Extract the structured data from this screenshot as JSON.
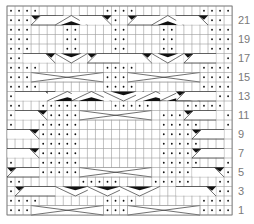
{
  "chart": {
    "columns": 28,
    "rows_count": 22,
    "grid": {
      "left": 7,
      "top": 6,
      "cell_w": 8.04,
      "cell_h": 9.5
    },
    "colors": {
      "grid": "#9a9a9a",
      "border": "#7a7a7a",
      "dot": "#111111",
      "fill": "#111111",
      "label": "#7a7a7a"
    },
    "legend_symbols": {
      ".": "purl",
      "-": "knit (blank)"
    },
    "rows_top_to_bottom": [
      "....--------....--------....",
      "...---------..----------...",
      "...----..----..----..----...",
      "...----..----..----..----...",
      "...----..----..----..----...",
      "...------------------------...",
      "....--------....--------....",
      "....--------....--------....",
      "....--------....--------....",
      "..------------------------..",
      "..--.....----.....----.....--..",
      ".---.....----------.....---.",
      ".---.....----------.....---.",
      "----.....----------.....----",
      "----.....----------.....----",
      "----.....----------.....----",
      ".---.....----------.....---.",
      ".---.....----------.....---.",
      "..-------.....----.....---..",
      "..------------------------..",
      "....--------....--------....",
      "....--------....--------...."
    ],
    "row_labels": [
      {
        "row": 21,
        "text": "21"
      },
      {
        "row": 19,
        "text": "19"
      },
      {
        "row": 17,
        "text": "17"
      },
      {
        "row": 15,
        "text": "15"
      },
      {
        "row": 13,
        "text": "13"
      },
      {
        "row": 11,
        "text": "11"
      },
      {
        "row": 9,
        "text": "9"
      },
      {
        "row": 7,
        "text": "7"
      },
      {
        "row": 5,
        "text": "5"
      },
      {
        "row": 3,
        "text": "3"
      },
      {
        "row": 1,
        "text": "1"
      }
    ],
    "cables": [
      {
        "row": 21,
        "type": "right",
        "from": 4,
        "to": 7
      },
      {
        "row": 21,
        "type": "peak",
        "from": 7,
        "to": 10
      },
      {
        "row": 21,
        "type": "left",
        "from": 10,
        "to": 13
      },
      {
        "row": 21,
        "type": "right",
        "from": 16,
        "to": 19
      },
      {
        "row": 21,
        "type": "peak",
        "from": 19,
        "to": 22
      },
      {
        "row": 21,
        "type": "left",
        "from": 22,
        "to": 25
      },
      {
        "row": 17,
        "type": "left",
        "from": 3,
        "to": 6
      },
      {
        "row": 17,
        "type": "valley",
        "from": 7,
        "to": 10
      },
      {
        "row": 17,
        "type": "right",
        "from": 11,
        "to": 14
      },
      {
        "row": 17,
        "type": "left",
        "from": 15,
        "to": 18
      },
      {
        "row": 17,
        "type": "valley",
        "from": 19,
        "to": 22
      },
      {
        "row": 17,
        "type": "right",
        "from": 23,
        "to": 26
      },
      {
        "row": 15,
        "type": "cross",
        "from": 4,
        "to": 12
      },
      {
        "row": 15,
        "type": "cross",
        "from": 16,
        "to": 24
      },
      {
        "row": 13,
        "type": "left",
        "from": 2,
        "to": 6
      },
      {
        "row": 13,
        "type": "peakfill",
        "from": 6,
        "to": 10
      },
      {
        "row": 13,
        "type": "peakfill",
        "from": 9,
        "to": 13
      },
      {
        "row": 13,
        "type": "valleyfill",
        "from": 13,
        "to": 17
      },
      {
        "row": 13,
        "type": "peakfill",
        "from": 17,
        "to": 21
      },
      {
        "row": 13,
        "type": "peakfill",
        "from": 20,
        "to": 24
      },
      {
        "row": 13,
        "type": "right",
        "from": 22,
        "to": 26
      },
      {
        "row": 11,
        "type": "left",
        "from": 2,
        "to": 5
      },
      {
        "row": 11,
        "type": "cross",
        "from": 10,
        "to": 18
      },
      {
        "row": 11,
        "type": "right",
        "from": 23,
        "to": 26
      },
      {
        "row": 9,
        "type": "left",
        "from": 1,
        "to": 4
      },
      {
        "row": 9,
        "type": "right",
        "from": 24,
        "to": 27
      },
      {
        "row": 7,
        "type": "left",
        "from": 1,
        "to": 4
      },
      {
        "row": 7,
        "type": "right",
        "from": 24,
        "to": 27
      },
      {
        "row": 5,
        "type": "right",
        "from": 1,
        "to": 4
      },
      {
        "row": 5,
        "type": "cross",
        "from": 10,
        "to": 18
      },
      {
        "row": 5,
        "type": "left",
        "from": 24,
        "to": 27
      },
      {
        "row": 3,
        "type": "right",
        "from": 2,
        "to": 6
      },
      {
        "row": 3,
        "type": "valleyfill",
        "from": 7,
        "to": 11
      },
      {
        "row": 3,
        "type": "valleyfill",
        "from": 11,
        "to": 15
      },
      {
        "row": 3,
        "type": "valleyfill",
        "from": 15,
        "to": 19
      },
      {
        "row": 3,
        "type": "left",
        "from": 22,
        "to": 26
      },
      {
        "row": 1,
        "type": "cross",
        "from": 4,
        "to": 12
      },
      {
        "row": 1,
        "type": "cross",
        "from": 16,
        "to": 24
      }
    ]
  }
}
